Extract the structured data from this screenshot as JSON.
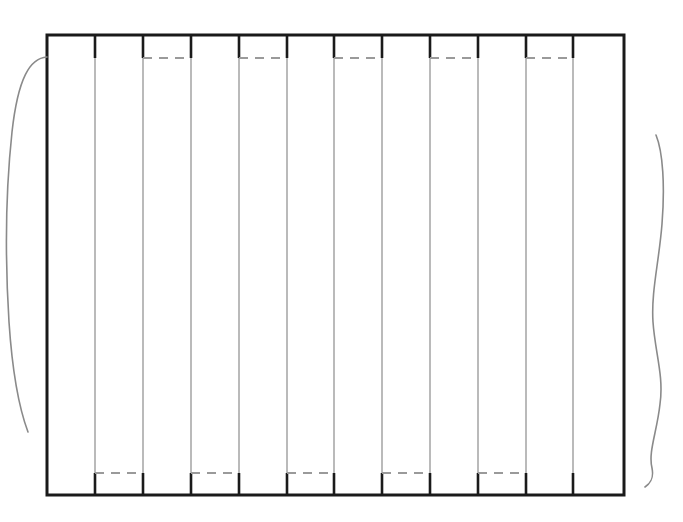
{
  "figure": {
    "canvas": {
      "width": 683,
      "height": 522,
      "background": "#ffffff"
    },
    "colors": {
      "outline": "#1a1a1a",
      "divider": "#8c8c8c",
      "seam_dash": "#9a9a9a",
      "stub": "#1a1a1a",
      "curve": "#8a8a8a",
      "background": "#ffffff"
    },
    "stroke_widths": {
      "outline": 3,
      "divider": 1.2,
      "seam_dash": 2,
      "stub": 2.6,
      "curve": 1.6
    }
  },
  "panel": {
    "name": "slatted-panel",
    "x": 47,
    "y": 35,
    "width": 577,
    "height": 460,
    "right": 624,
    "bottom": 495,
    "slat_count": 12,
    "divider_x": [
      95,
      143,
      191,
      239,
      287,
      334,
      382,
      430,
      478,
      526,
      573
    ],
    "slat_edges": [
      47,
      95,
      143,
      191,
      239,
      287,
      334,
      382,
      430,
      478,
      526,
      573,
      624
    ]
  },
  "seams": {
    "top": {
      "y": 58,
      "label": "upper seam line",
      "dash_pattern": "9 7",
      "slat_indices": [
        2,
        4,
        6,
        8,
        10
      ],
      "segments": [
        {
          "x1": 143,
          "x2": 191
        },
        {
          "x1": 239,
          "x2": 287
        },
        {
          "x1": 334,
          "x2": 382
        },
        {
          "x1": 430,
          "x2": 478
        },
        {
          "x1": 526,
          "x2": 573
        }
      ]
    },
    "bottom": {
      "y": 473,
      "label": "lower seam line",
      "dash_pattern": "9 7",
      "slat_indices": [
        1,
        3,
        5,
        7,
        9
      ],
      "segments": [
        {
          "x1": 95,
          "x2": 143
        },
        {
          "x1": 191,
          "x2": 239
        },
        {
          "x1": 287,
          "x2": 334
        },
        {
          "x1": 382,
          "x2": 430
        },
        {
          "x1": 478,
          "x2": 526
        }
      ]
    }
  },
  "stubs": {
    "top": [
      {
        "x": 143,
        "y1": 35,
        "y2": 58
      },
      {
        "x": 191,
        "y1": 35,
        "y2": 58
      },
      {
        "x": 239,
        "y1": 35,
        "y2": 58
      },
      {
        "x": 287,
        "y1": 35,
        "y2": 58
      },
      {
        "x": 334,
        "y1": 35,
        "y2": 58
      },
      {
        "x": 382,
        "y1": 35,
        "y2": 58
      },
      {
        "x": 430,
        "y1": 35,
        "y2": 58
      },
      {
        "x": 478,
        "y1": 35,
        "y2": 58
      },
      {
        "x": 526,
        "y1": 35,
        "y2": 58
      },
      {
        "x": 573,
        "y1": 35,
        "y2": 58
      },
      {
        "x": 95,
        "y1": 35,
        "y2": 58
      }
    ],
    "bottom": [
      {
        "x": 95,
        "y1": 473,
        "y2": 495
      },
      {
        "x": 143,
        "y1": 473,
        "y2": 495
      },
      {
        "x": 191,
        "y1": 473,
        "y2": 495
      },
      {
        "x": 239,
        "y1": 473,
        "y2": 495
      },
      {
        "x": 287,
        "y1": 473,
        "y2": 495
      },
      {
        "x": 334,
        "y1": 473,
        "y2": 495
      },
      {
        "x": 382,
        "y1": 473,
        "y2": 495
      },
      {
        "x": 430,
        "y1": 473,
        "y2": 495
      },
      {
        "x": 478,
        "y1": 473,
        "y2": 495
      },
      {
        "x": 526,
        "y1": 473,
        "y2": 495
      },
      {
        "x": 573,
        "y1": 473,
        "y2": 495
      }
    ]
  },
  "curves": {
    "left": {
      "name": "left-break-curve",
      "path": "M 47 57 C 30 58, 18 78, 12 132 C 6 188, 5 258, 9 322 C 13 382, 22 416, 28 432",
      "start": {
        "x": 47,
        "y": 57
      },
      "end": {
        "x": 28,
        "y": 432
      }
    },
    "right": {
      "name": "right-break-curve",
      "path": "M 656 135 C 663 152, 665 186, 662 224 C 659 262, 651 292, 653 322 C 655 352, 664 376, 660 404 C 657 432, 648 452, 652 468 C 654 478, 651 483, 645 487",
      "start": {
        "x": 656,
        "y": 135
      },
      "end": {
        "x": 645,
        "y": 487
      }
    }
  },
  "chart_data": {
    "type": "table",
    "xlabel": "",
    "ylabel": "",
    "categories": [
      "slat-1",
      "slat-2",
      "slat-3",
      "slat-4",
      "slat-5",
      "slat-6",
      "slat-7",
      "slat-8",
      "slat-9",
      "slat-10",
      "slat-11",
      "slat-12"
    ],
    "series": [
      {
        "name": "slat left edge (px)",
        "values": [
          47,
          95,
          143,
          191,
          239,
          287,
          334,
          382,
          430,
          478,
          526,
          573
        ]
      },
      {
        "name": "slat right edge (px)",
        "values": [
          95,
          143,
          191,
          239,
          287,
          334,
          382,
          430,
          478,
          526,
          573,
          624
        ]
      },
      {
        "name": "slat width (px)",
        "values": [
          48,
          48,
          48,
          48,
          48,
          47,
          48,
          48,
          48,
          48,
          47,
          51
        ]
      },
      {
        "name": "top seam present",
        "values": [
          0,
          0,
          1,
          0,
          1,
          0,
          1,
          0,
          1,
          0,
          1,
          0
        ]
      },
      {
        "name": "bottom seam present",
        "values": [
          0,
          1,
          0,
          1,
          0,
          1,
          0,
          1,
          0,
          1,
          0,
          0
        ]
      }
    ],
    "annotations": [
      "Top seam line at y = 58 px",
      "Bottom seam line at y = 473 px",
      "Panel outer rectangle: x 47 to 624, y 35 to 495",
      "Freehand break curve at left and right margins"
    ],
    "grid": false,
    "legend": "none"
  }
}
